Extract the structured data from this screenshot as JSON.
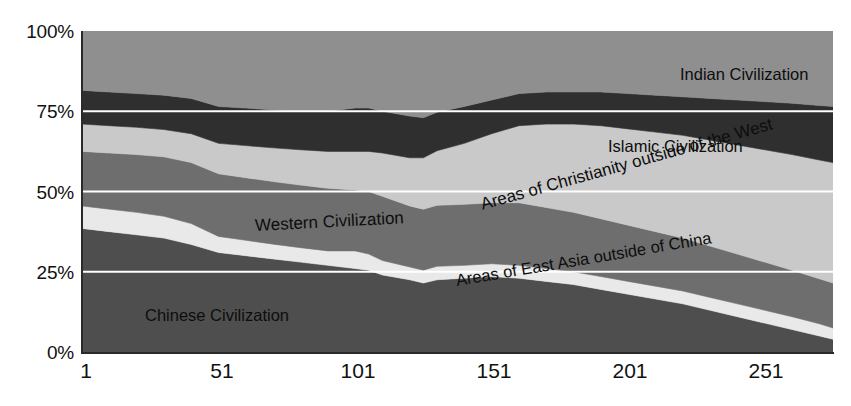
{
  "chart_data": {
    "type": "area",
    "title": "",
    "subtitle": "",
    "xlabel": "",
    "ylabel": "",
    "stacked": true,
    "normalized_percent": true,
    "grid": true,
    "gridlines_color": "#ffffff",
    "legend_position": "inline-labels",
    "ylim": [
      0,
      100
    ],
    "xlim": [
      1,
      276
    ],
    "y_ticks": [
      "0%",
      "25%",
      "50%",
      "75%",
      "100%"
    ],
    "y_tick_values": [
      0,
      25,
      50,
      75,
      100
    ],
    "x_ticks": [
      "1",
      "51",
      "101",
      "151",
      "201",
      "251"
    ],
    "x_tick_values": [
      1,
      51,
      101,
      151,
      201,
      251
    ],
    "x": [
      1,
      11,
      21,
      31,
      41,
      51,
      61,
      71,
      81,
      91,
      101,
      106,
      111,
      121,
      126,
      131,
      141,
      151,
      161,
      171,
      181,
      191,
      201,
      211,
      221,
      231,
      241,
      251,
      261,
      271,
      276
    ],
    "series": [
      {
        "name": "Chinese Civilization",
        "color": "#4e4e4e",
        "label_color": "#0a0a0a",
        "values": [
          38.5,
          37.5,
          36.5,
          35.5,
          33.5,
          31.0,
          30.0,
          29.0,
          28.0,
          27.0,
          26.0,
          25.5,
          24.0,
          22.5,
          21.5,
          22.5,
          23.0,
          23.5,
          23.0,
          22.0,
          21.0,
          19.5,
          18.0,
          16.5,
          15.0,
          13.0,
          11.0,
          9.0,
          7.0,
          5.0,
          4.0
        ]
      },
      {
        "name": "Areas of East Asia outside of China",
        "color": "#e9e9e9",
        "label_color": "#0a0a0a",
        "values": [
          7.0,
          7.0,
          7.0,
          6.8,
          6.5,
          5.0,
          4.8,
          4.6,
          4.5,
          4.5,
          5.5,
          5.0,
          4.5,
          4.0,
          4.0,
          4.2,
          4.0,
          4.0,
          4.0,
          4.0,
          4.0,
          4.0,
          4.0,
          4.0,
          4.0,
          4.0,
          4.0,
          4.0,
          4.0,
          3.8,
          3.5
        ]
      },
      {
        "name": "Western Civilization",
        "color": "#6e6e6e",
        "label_color": "#0a0a0a",
        "values": [
          17.0,
          17.5,
          18.0,
          18.5,
          19.0,
          19.5,
          19.5,
          19.5,
          19.5,
          19.5,
          19.0,
          19.5,
          20.0,
          19.0,
          19.0,
          19.0,
          19.0,
          19.0,
          19.5,
          19.0,
          18.5,
          18.0,
          17.5,
          17.0,
          16.5,
          16.0,
          15.5,
          15.0,
          14.5,
          14.0,
          14.0
        ]
      },
      {
        "name": "Areas of Christianity outside of the West",
        "color": "#c9c9c9",
        "label_color": "#0a0a0a",
        "values": [
          8.5,
          8.5,
          8.5,
          8.5,
          9.0,
          9.5,
          10.0,
          10.5,
          11.0,
          11.5,
          12.0,
          12.5,
          13.5,
          15.0,
          16.0,
          17.0,
          19.0,
          21.5,
          24.0,
          26.0,
          27.5,
          29.0,
          30.0,
          31.0,
          32.0,
          33.0,
          34.0,
          35.0,
          36.0,
          37.0,
          37.5
        ]
      },
      {
        "name": "Islamic Civilization",
        "color": "#2f2f2f",
        "label_color": "#0a0a0a",
        "values": [
          10.5,
          10.5,
          10.5,
          10.7,
          11.0,
          11.5,
          11.7,
          11.8,
          12.0,
          12.5,
          13.5,
          13.5,
          13.0,
          13.0,
          12.5,
          12.0,
          11.5,
          10.5,
          10.0,
          10.0,
          10.0,
          10.5,
          11.0,
          11.5,
          12.0,
          13.0,
          14.0,
          15.0,
          16.0,
          17.0,
          17.5
        ]
      },
      {
        "name": "Indian Civilization",
        "color": "#8f8f8f",
        "label_color": "#0a0a0a",
        "values": [
          18.5,
          19.0,
          19.5,
          20.0,
          21.0,
          23.5,
          24.0,
          24.6,
          25.0,
          25.0,
          24.0,
          24.0,
          25.0,
          26.5,
          27.0,
          25.3,
          23.5,
          21.5,
          19.5,
          19.0,
          19.0,
          19.0,
          19.5,
          20.0,
          20.5,
          21.0,
          21.5,
          22.0,
          22.5,
          23.2,
          23.5
        ]
      }
    ]
  },
  "axes": {
    "y_ticks": [
      {
        "label": "100%",
        "value": 100
      },
      {
        "label": "75%",
        "value": 75
      },
      {
        "label": "50%",
        "value": 50
      },
      {
        "label": "25%",
        "value": 25
      },
      {
        "label": "0%",
        "value": 0
      }
    ],
    "x_ticks": [
      {
        "label": "1",
        "value": 1
      },
      {
        "label": "51",
        "value": 51
      },
      {
        "label": "101",
        "value": 101
      },
      {
        "label": "151",
        "value": 151
      },
      {
        "label": "201",
        "value": 201
      },
      {
        "label": "251",
        "value": 251
      }
    ]
  },
  "series_labels": {
    "indian": "Indian Civilization",
    "islamic": "Islamic Civilization",
    "christianity": "Areas of Christianity outside of the West",
    "east_asia": "Areas of East Asia outside of China",
    "western": "Western Civilization",
    "chinese": "Chinese Civilization"
  },
  "colors": {
    "indian": "#8f8f8f",
    "islamic": "#2f2f2f",
    "christianity": "#c9c9c9",
    "western": "#6e6e6e",
    "east_asia": "#e9e9e9",
    "chinese": "#4e4e4e",
    "gridline": "#ffffff",
    "axis": "#2a2a2a",
    "text": "#111111",
    "background": "#ffffff"
  }
}
